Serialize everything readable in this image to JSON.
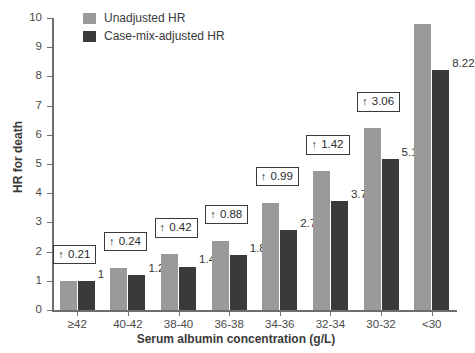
{
  "chart_data": {
    "type": "bar",
    "title": "",
    "xlabel": "Serum albumin concentration (g/L)",
    "ylabel": "HR for death",
    "categories": [
      "≥42",
      "40-42",
      "38-40",
      "36-38",
      "34-36",
      "32-34",
      "30-32",
      "<30"
    ],
    "ylim": [
      0,
      10
    ],
    "yticks": [
      0,
      1,
      2,
      3,
      4,
      5,
      6,
      7,
      8,
      9,
      10
    ],
    "ytick_labels": [
      "0",
      "1",
      "2",
      "3",
      "4",
      "5",
      "6",
      "7",
      "8",
      "9",
      "10"
    ],
    "grid": false,
    "legend_position": "top-left",
    "series": [
      {
        "name": "Unadjusted HR",
        "color": "#9a9a9a",
        "values": [
          1.0,
          1.45,
          1.91,
          2.38,
          3.67,
          4.76,
          6.22,
          9.78
        ],
        "labels": [
          "",
          "",
          "",
          "",
          "",
          "",
          "",
          ""
        ]
      },
      {
        "name": "Case-mix-adjusted HR",
        "color": "#3a3a3a",
        "values": [
          1.0,
          1.21,
          1.49,
          1.87,
          2.75,
          3.74,
          5.16,
          8.22
        ],
        "labels": [
          "1",
          "1.21",
          "1.49",
          "1.87",
          "2.75",
          "3.74",
          "5.16",
          "8.22"
        ]
      }
    ],
    "annotations": [
      {
        "category": "≥42",
        "arrow": "↑",
        "value": "0.21"
      },
      {
        "category": "40-42",
        "arrow": "↑",
        "value": "0.24"
      },
      {
        "category": "38-40",
        "arrow": "↑",
        "value": "0.42"
      },
      {
        "category": "36-38",
        "arrow": "↑",
        "value": "0.88"
      },
      {
        "category": "34-36",
        "arrow": "↑",
        "value": "0.99"
      },
      {
        "category": "32-34",
        "arrow": "↑",
        "value": "1.42"
      },
      {
        "category": "30-32",
        "arrow": "↑",
        "value": "3.06"
      }
    ]
  },
  "legend": {
    "items": [
      {
        "label": "Unadjusted HR",
        "color": "#9a9a9a"
      },
      {
        "label": "Case-mix-adjusted HR",
        "color": "#3a3a3a"
      }
    ]
  },
  "colors": {
    "unadjusted": "#9a9a9a",
    "adjusted": "#3a3a3a",
    "axis": "#6e6e6e",
    "text": "#3a3a3a",
    "background": "#ffffff"
  }
}
